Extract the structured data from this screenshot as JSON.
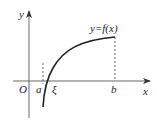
{
  "diagram": {
    "axes": {
      "x_label": "x",
      "y_label": "y",
      "origin_label": "O"
    },
    "curve_label": "y=f(x)",
    "points": {
      "a_label": "a",
      "xi_label": "ξ",
      "b_label": "b"
    },
    "colors": {
      "axis": "#555555",
      "curve": "#222222",
      "dashed": "#444444"
    }
  }
}
